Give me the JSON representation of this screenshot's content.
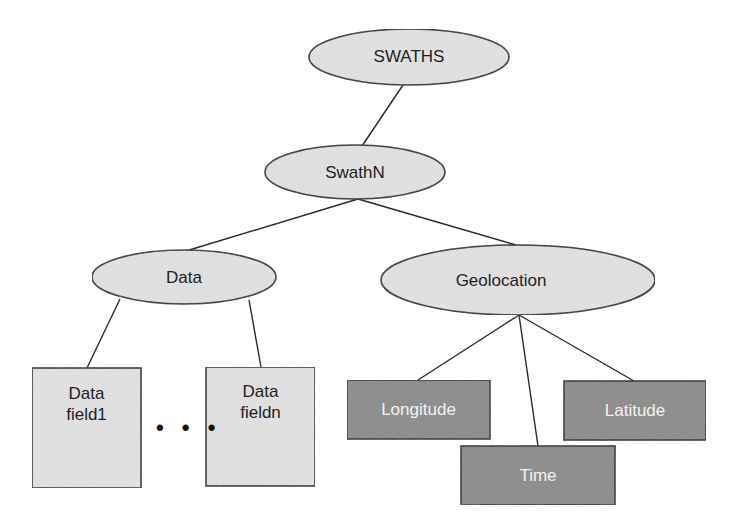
{
  "diagram": {
    "nodes": {
      "root": {
        "label": "SWATHS",
        "shape": "ellipse"
      },
      "swath": {
        "label": "SwathN",
        "shape": "ellipse"
      },
      "data": {
        "label": "Data",
        "shape": "ellipse"
      },
      "geolocation": {
        "label": "Geolocation",
        "shape": "ellipse"
      },
      "data_field_first": {
        "line1": "Data",
        "line2": "field1",
        "shape": "rect"
      },
      "data_field_last": {
        "line1": "Data",
        "line2": "fieldn",
        "shape": "rect"
      },
      "longitude": {
        "label": "Longitude",
        "shape": "rect-dark"
      },
      "latitude": {
        "label": "Latitude",
        "shape": "rect-dark"
      },
      "time": {
        "label": "Time",
        "shape": "rect-dark"
      }
    },
    "ellipsis": "• • •",
    "edges": [
      [
        "SWATHS",
        "SwathN"
      ],
      [
        "SwathN",
        "Data"
      ],
      [
        "SwathN",
        "Geolocation"
      ],
      [
        "Data",
        "Data field1"
      ],
      [
        "Data",
        "Data fieldn"
      ],
      [
        "Geolocation",
        "Longitude"
      ],
      [
        "Geolocation",
        "Time"
      ],
      [
        "Geolocation",
        "Latitude"
      ]
    ],
    "colors": {
      "light_fill": "#e3e3e3",
      "dark_fill": "#8a8a8a",
      "stroke": "#2a2a2a",
      "text_dark": "#1e1e1e",
      "text_light": "#f2f2f2"
    }
  }
}
